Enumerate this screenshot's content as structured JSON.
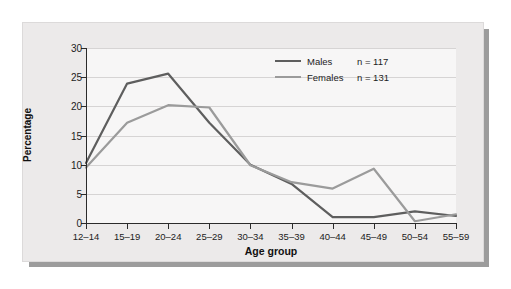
{
  "chart_data": {
    "type": "line",
    "title": "",
    "xlabel": "Age group",
    "ylabel": "Percentage",
    "categories": [
      "12–14",
      "15–19",
      "20–24",
      "25–29",
      "30–34",
      "35–39",
      "40–44",
      "45–49",
      "50–54",
      "55–59"
    ],
    "yticks": [
      0,
      5,
      10,
      15,
      20,
      25,
      30
    ],
    "ylim": [
      0,
      30
    ],
    "grid": true,
    "legend_position": "top-right",
    "series": [
      {
        "name": "Males",
        "n_label": "n = 117",
        "color": "#5e5e5e",
        "values": [
          10.3,
          23.9,
          25.6,
          17.2,
          10.0,
          6.7,
          1.0,
          1.0,
          2.0,
          1.2
        ]
      },
      {
        "name": "Females",
        "n_label": "n = 131",
        "color": "#9b9b9b",
        "values": [
          9.5,
          17.2,
          20.2,
          19.8,
          9.9,
          7.0,
          5.9,
          9.3,
          0.3,
          1.5
        ]
      }
    ]
  },
  "colors": {
    "males_line": "#5e5e5e",
    "females_line": "#9b9b9b",
    "card_background": "#eceaea",
    "plot_background": "#f7f6f6",
    "gridline": "#d6d4d4",
    "axis": "#2b2b2b"
  }
}
